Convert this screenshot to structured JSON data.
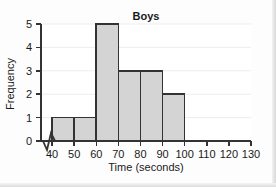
{
  "chart_data": {
    "type": "bar",
    "title": "Boys",
    "xlabel": "Time (seconds)",
    "ylabel": "Frequency",
    "xlim": [
      35,
      130
    ],
    "ylim": [
      0,
      5
    ],
    "x_ticks": [
      40,
      50,
      60,
      70,
      80,
      90,
      100,
      110,
      120,
      130
    ],
    "y_ticks": [
      0,
      1,
      2,
      3,
      4,
      5
    ],
    "x_tick_labels": [
      "40",
      "50",
      "60",
      "70",
      "80",
      "90",
      "100",
      "110",
      "120",
      "130"
    ],
    "y_tick_labels": [
      "0",
      "1",
      "2",
      "3",
      "4",
      "5"
    ],
    "axis_break": true,
    "grid": "horizontal",
    "legend": "none",
    "bin_width": 10,
    "categories": [
      "40-50",
      "50-60",
      "60-70",
      "70-80",
      "80-90",
      "90-100"
    ],
    "bins": [
      {
        "start": 40,
        "end": 50,
        "value": 1
      },
      {
        "start": 50,
        "end": 60,
        "value": 1
      },
      {
        "start": 60,
        "end": 70,
        "value": 5
      },
      {
        "start": 70,
        "end": 80,
        "value": 3
      },
      {
        "start": 80,
        "end": 90,
        "value": 3
      },
      {
        "start": 90,
        "end": 100,
        "value": 2
      }
    ],
    "values": [
      1,
      1,
      5,
      3,
      3,
      2
    ],
    "colors": {
      "bar_fill": "#d4d4d4",
      "bar_stroke": "#333333",
      "axis": "#333333",
      "grid": "#ededed",
      "text": "#1a1a1a",
      "plot_background": "#ffffff"
    }
  }
}
